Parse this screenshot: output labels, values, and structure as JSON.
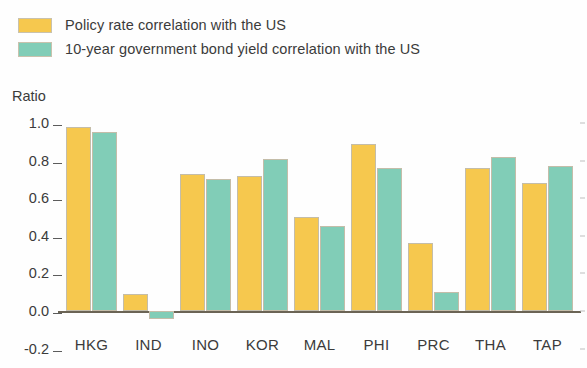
{
  "legend": {
    "position": "top-left",
    "items": [
      {
        "label": "Policy rate correlation with the US",
        "color": "#f6c84e",
        "key": "policy"
      },
      {
        "label": "10-year government bond yield correlation with the US",
        "color": "#81cdb7",
        "key": "bond"
      }
    ]
  },
  "axis": {
    "y_title": "Ratio",
    "ticks": [
      "1.0",
      "0.8",
      "0.6",
      "0.4",
      "0.2",
      "0.0",
      "-0.2"
    ]
  },
  "chart_data": {
    "type": "bar",
    "title": "",
    "subtitle": "",
    "xlabel": "",
    "ylabel": "Ratio",
    "ylim": [
      -0.2,
      1.0
    ],
    "yticks": [
      -0.2,
      0.0,
      0.2,
      0.4,
      0.6,
      0.8,
      1.0
    ],
    "grid": false,
    "legend_position": "top-left",
    "categories": [
      "HKG",
      "IND",
      "INO",
      "KOR",
      "MAL",
      "PHI",
      "PRC",
      "THA",
      "TAP"
    ],
    "series": [
      {
        "name": "Policy rate correlation with the US",
        "color": "#f6c84e",
        "values": [
          0.98,
          0.09,
          0.73,
          0.72,
          0.5,
          0.89,
          0.36,
          0.76,
          0.68
        ]
      },
      {
        "name": "10-year government bond yield correlation with the US",
        "color": "#81cdb7",
        "values": [
          0.95,
          -0.04,
          0.7,
          0.81,
          0.45,
          0.76,
          0.1,
          0.82,
          0.77
        ]
      }
    ]
  }
}
